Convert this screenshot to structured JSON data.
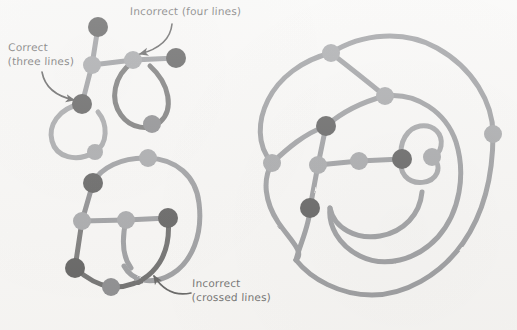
{
  "page": {
    "width": 517,
    "height": 330,
    "background_color": "#f6f5f3"
  },
  "palette": {
    "ink_black": "#1a1a1a",
    "node_black": "#161616",
    "node_dark_gray": "#55565a",
    "node_gray": "#7d7f83",
    "line_gray": "#6e7074",
    "line_dark": "#2a2a2a",
    "text": "#2b2b2b",
    "paper": "#f6f5f3"
  },
  "labels": [
    {
      "id": "correct",
      "name": "label-correct-three-lines",
      "line1": "Correct",
      "line2": "(three lines)",
      "x": 8,
      "y": 40,
      "arrow": {
        "name": "arrow-to-correct-node",
        "from": [
          42,
          72
        ],
        "to": [
          76,
          100
        ],
        "control": [
          46,
          94
        ]
      }
    },
    {
      "id": "four_lines",
      "name": "label-incorrect-four-lines",
      "line1": "Incorrect (four lines)",
      "line2": "",
      "x": 130,
      "y": 4,
      "arrow": {
        "name": "arrow-to-four-line-node",
        "from": [
          172,
          24
        ],
        "to": [
          137,
          54
        ],
        "control": [
          168,
          48
        ]
      }
    },
    {
      "id": "crossed",
      "name": "label-incorrect-crossed-lines",
      "line1": "Incorrect",
      "line2": "(crossed lines)",
      "x": 192,
      "y": 276,
      "arrow": {
        "name": "arrow-to-crossing-point",
        "from": [
          190,
          293
        ],
        "to": [
          152,
          274
        ],
        "control": [
          168,
          297
        ]
      }
    }
  ],
  "figures": [
    {
      "id": "figure-top-left",
      "name": "diagram-top-left",
      "description": "Two-loop figure showing a correct three-line junction and an incorrect four-line junction",
      "nodes": [
        {
          "name": "node-top-black",
          "x": 98,
          "y": 27,
          "r": 10,
          "color": "#161616"
        },
        {
          "name": "node-junction-three",
          "x": 92,
          "y": 65,
          "r": 9,
          "color": "#7d7f83"
        },
        {
          "name": "node-junction-four",
          "x": 133,
          "y": 60,
          "r": 9,
          "color": "#7d7f83"
        },
        {
          "name": "node-right-black",
          "x": 176,
          "y": 58,
          "r": 10,
          "color": "#161616"
        },
        {
          "name": "node-correct-black",
          "x": 82,
          "y": 104,
          "r": 10,
          "color": "#161616"
        },
        {
          "name": "node-left-loop-gray",
          "x": 95,
          "y": 152,
          "r": 8,
          "color": "#7d7f83"
        },
        {
          "name": "node-right-loop-dark",
          "x": 152,
          "y": 124,
          "r": 9,
          "color": "#55565a"
        }
      ],
      "edges": [
        {
          "name": "edge-top-black-to-junction-three",
          "color": "#6e7074",
          "width": 5
        },
        {
          "name": "edge-junction-three-to-four",
          "color": "#6e7074",
          "width": 5
        },
        {
          "name": "edge-junction-four-to-right-black",
          "color": "#6e7074",
          "width": 5
        },
        {
          "name": "edge-junction-three-to-correct",
          "color": "#6e7074",
          "width": 5
        },
        {
          "name": "loop-left",
          "color": "#77797d",
          "width": 5
        },
        {
          "name": "loop-right",
          "color": "#3a3a3a",
          "width": 5
        }
      ]
    },
    {
      "id": "figure-bottom-left",
      "name": "diagram-bottom-left",
      "description": "Closed outline with an internal path that crosses the outline",
      "nodes": [
        {
          "name": "node-top-gray",
          "x": 148,
          "y": 158,
          "r": 9,
          "color": "#7d7f83"
        },
        {
          "name": "node-upper-black",
          "x": 93,
          "y": 183,
          "r": 10,
          "color": "#161616"
        },
        {
          "name": "node-mid-left-gray",
          "x": 82,
          "y": 221,
          "r": 9,
          "color": "#7d7f83"
        },
        {
          "name": "node-mid-gray",
          "x": 126,
          "y": 220,
          "r": 9,
          "color": "#7d7f83"
        },
        {
          "name": "node-right-black",
          "x": 168,
          "y": 218,
          "r": 10,
          "color": "#161616"
        },
        {
          "name": "node-lower-black",
          "x": 75,
          "y": 268,
          "r": 10,
          "color": "#161616"
        },
        {
          "name": "node-bottom-dark",
          "x": 111,
          "y": 287,
          "r": 9,
          "color": "#55565a"
        }
      ],
      "edges": [
        {
          "name": "edge-outline-top",
          "color": "#6e7074",
          "width": 5
        },
        {
          "name": "edge-outline-right",
          "color": "#6e7074",
          "width": 5
        },
        {
          "name": "edge-upper-black-to-mid-left",
          "color": "#55565a",
          "width": 5
        },
        {
          "name": "edge-mid-left-to-mid",
          "color": "#6e7074",
          "width": 5
        },
        {
          "name": "edge-mid-to-right-black",
          "color": "#6e7074",
          "width": 5
        },
        {
          "name": "edge-mid-left-to-lower-black",
          "color": "#3a3a3a",
          "width": 5
        },
        {
          "name": "edge-lower-black-to-bottom",
          "color": "#2e2e2e",
          "width": 5
        },
        {
          "name": "edge-crossing-curve",
          "color": "#2a2a2a",
          "width": 5
        }
      ],
      "crossing_point": {
        "name": "crossing-point",
        "x": 152,
        "y": 272
      }
    },
    {
      "id": "figure-right",
      "name": "diagram-right",
      "description": "Large spiral figure with nested loops, a small inner loop, and three-line junctions",
      "nodes": [
        {
          "name": "node-outer-top-gray",
          "x": 331,
          "y": 53,
          "r": 9,
          "color": "#7d7f83"
        },
        {
          "name": "node-inner-top-gray",
          "x": 385,
          "y": 96,
          "r": 9,
          "color": "#7d7f83"
        },
        {
          "name": "node-upper-black",
          "x": 326,
          "y": 126,
          "r": 10,
          "color": "#161616"
        },
        {
          "name": "node-left-gray",
          "x": 272,
          "y": 163,
          "r": 9,
          "color": "#7d7f83"
        },
        {
          "name": "node-center-left-gray",
          "x": 318,
          "y": 165,
          "r": 9,
          "color": "#7d7f83"
        },
        {
          "name": "node-center-gray",
          "x": 359,
          "y": 161,
          "r": 9,
          "color": "#7d7f83"
        },
        {
          "name": "node-center-black",
          "x": 402,
          "y": 159,
          "r": 10,
          "color": "#161616"
        },
        {
          "name": "node-small-loop-gray",
          "x": 432,
          "y": 157,
          "r": 9,
          "color": "#7d7f83"
        },
        {
          "name": "node-far-right-gray",
          "x": 493,
          "y": 134,
          "r": 9,
          "color": "#7d7f83"
        },
        {
          "name": "node-lower-black",
          "x": 310,
          "y": 208,
          "r": 10,
          "color": "#161616"
        }
      ],
      "edges": [
        {
          "name": "spiral-outer",
          "color": "#6e7074",
          "width": 5
        },
        {
          "name": "spiral-middle",
          "color": "#6e7074",
          "width": 5
        },
        {
          "name": "spiral-inner",
          "color": "#6e7074",
          "width": 5
        },
        {
          "name": "small-loop",
          "color": "#7a7c80",
          "width": 5
        },
        {
          "name": "edge-center-spine",
          "color": "#6e7074",
          "width": 5
        },
        {
          "name": "edge-upper-black-to-center-left",
          "color": "#6e7074",
          "width": 5
        },
        {
          "name": "edge-center-left-to-lower-black",
          "color": "#6e7074",
          "width": 5
        }
      ]
    }
  ]
}
